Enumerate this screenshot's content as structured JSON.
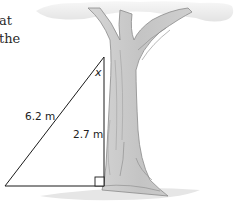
{
  "question_text_fragments": [
    {
      "text": "at",
      "x": 0,
      "y": 13
    },
    {
      "text": "the",
      "x": 0,
      "y": 31
    }
  ],
  "figure": {
    "type": "right-triangle-with-tree",
    "labels": {
      "hypotenuse": "6.2 m",
      "vertical_side": "2.7 m",
      "angle": "x"
    },
    "colors": {
      "line": "#1a1a1a",
      "trunk_fill": "#c9c9c9",
      "trunk_edge": "#8a8a8a",
      "foliage": "#ececec",
      "ground": "#dedede"
    }
  }
}
